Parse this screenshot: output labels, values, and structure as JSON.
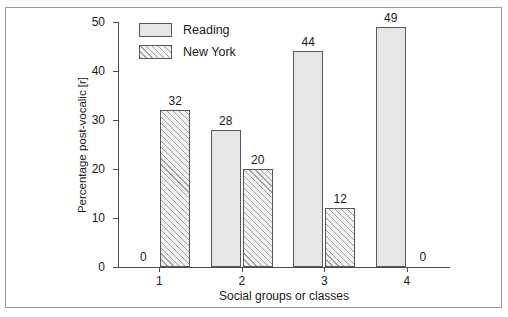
{
  "chart_data": {
    "type": "bar",
    "title": "",
    "subtitle": "",
    "xlabel": "Social groups or classes",
    "ylabel": "Percentage post-vocalic [r]",
    "categories": [
      "1",
      "2",
      "3",
      "4"
    ],
    "ylim": [
      0,
      50
    ],
    "yticks": [
      0,
      10,
      20,
      30,
      40,
      50
    ],
    "ytick_labels": [
      "0",
      "10",
      "20",
      "30",
      "40",
      "50"
    ],
    "grid": false,
    "legend_position": "top-left-inside",
    "series": [
      {
        "name": "Reading",
        "fill": "solid",
        "color": "#e6e6e6",
        "values": [
          0,
          28,
          44,
          49
        ],
        "value_labels": [
          "0",
          "28",
          "44",
          "49"
        ]
      },
      {
        "name": "New York",
        "fill": "hatched",
        "color": "#f2f2f2",
        "values": [
          32,
          20,
          12,
          0
        ],
        "value_labels": [
          "32",
          "20",
          "12",
          "0"
        ]
      }
    ]
  },
  "legend": {
    "items": [
      {
        "label": "Reading",
        "swatch": "solid-swatch"
      },
      {
        "label": "New York",
        "swatch": "hatched-swatch"
      }
    ]
  },
  "colors": {
    "bar_solid": "#e6e6e6",
    "bar_hatched": "#f2f2f2",
    "bar_outline": "#55595c",
    "axis": "#4d4d4d",
    "text": "#1b1b1b",
    "frame": "#9a9a9a",
    "background": "#ffffff"
  }
}
